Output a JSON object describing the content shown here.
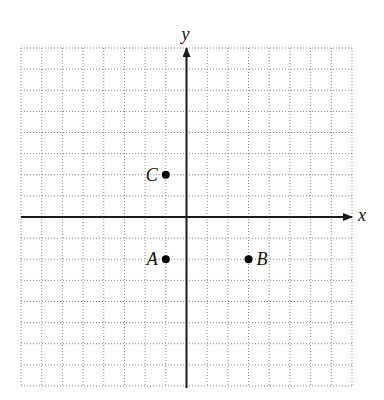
{
  "chart_data": {
    "type": "scatter",
    "title": "",
    "xlabel": "x",
    "ylabel": "y",
    "xlim": [
      -8,
      8
    ],
    "ylim": [
      -8,
      8
    ],
    "grid": true,
    "grid_style": "dotted",
    "tick_labels": false,
    "points": [
      {
        "label": "A",
        "x": -1,
        "y": -2,
        "label_position": "left"
      },
      {
        "label": "B",
        "x": 3,
        "y": -2,
        "label_position": "right"
      },
      {
        "label": "C",
        "x": -1,
        "y": 2,
        "label_position": "left"
      }
    ]
  },
  "axes": {
    "x_label": "x",
    "y_label": "y"
  },
  "points": {
    "a": {
      "label": "A"
    },
    "b": {
      "label": "B"
    },
    "c": {
      "label": "C"
    }
  },
  "colors": {
    "axis": "#1a1a1a",
    "grid": "#8a8a8a",
    "point": "#000000",
    "background": "#ffffff"
  }
}
